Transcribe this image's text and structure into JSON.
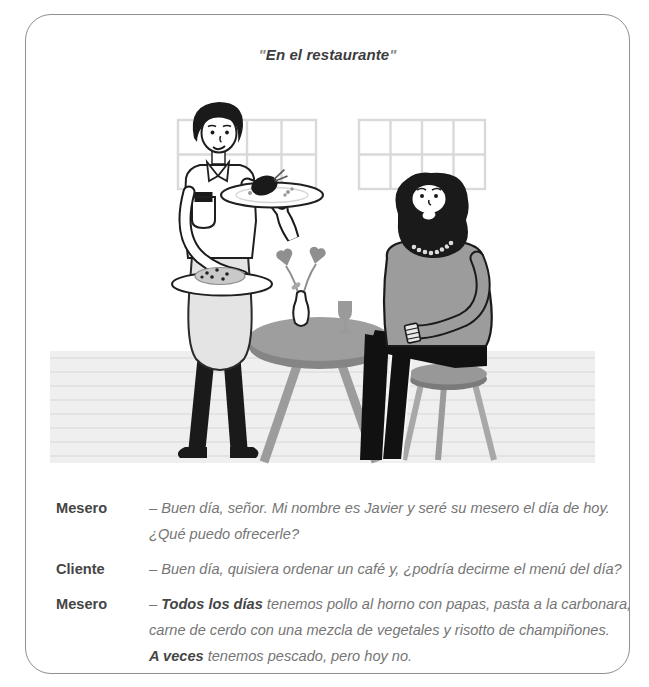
{
  "title": {
    "open_quote": "\"",
    "text": "En el restaurante",
    "close_quote": "\""
  },
  "illustration": {
    "scene": "waiter-serving-seated-customer-at-round-table",
    "elements": [
      "window-grid-left",
      "window-grid-right",
      "striped-floor",
      "round-table",
      "vase-with-flowers",
      "wine-glass",
      "waiter-holding-two-plates",
      "plate-with-roast-chicken",
      "plate-with-pasta",
      "bearded-customer-seated",
      "stool"
    ]
  },
  "dialogue": [
    {
      "speaker": "Mesero",
      "lines": [
        [
          {
            "t": "– Buen día, señor. Mi nombre es Javier y seré su mesero el día de hoy.",
            "b": false
          }
        ],
        [
          {
            "t": "¿Qué puedo ofrecerle?",
            "b": false
          }
        ]
      ]
    },
    {
      "speaker": "Cliente",
      "lines": [
        [
          {
            "t": "– Buen día, quisiera ordenar un café y, ¿podría decirme el menú del día?",
            "b": false
          }
        ]
      ]
    },
    {
      "speaker": "Mesero",
      "lines": [
        [
          {
            "t": "– ",
            "b": false
          },
          {
            "t": "Todos los días",
            "b": true
          },
          {
            "t": " tenemos pollo al horno con papas, pasta a la carbonara,",
            "b": false
          }
        ],
        [
          {
            "t": "carne de cerdo con una mezcla de vegetales y risotto de champiñones.",
            "b": false
          }
        ],
        [
          {
            "t": "A veces",
            "b": true
          },
          {
            "t": " tenemos pescado, pero hoy no.",
            "b": false
          }
        ]
      ]
    }
  ],
  "colors": {
    "card_border": "#8f8f8f",
    "title_text": "#3d3d3d",
    "speaker_label": "#454545",
    "dialogue_text": "#757575",
    "ink": "#1f1f1f",
    "mid_gray": "#9c9c9c",
    "dark_gray": "#7d7d7d",
    "light_gray": "#e4e4e4",
    "floor_fill": "#efefef",
    "floor_line": "#dfdfdf",
    "window_line": "#d9d9d9"
  }
}
